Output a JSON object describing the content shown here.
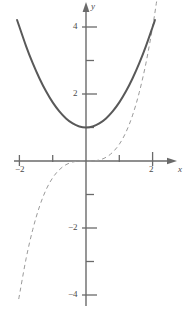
{
  "figure": {
    "background_color": "#ffffff",
    "width": 187,
    "height": 316
  },
  "axes": {
    "x_axis_label": "x",
    "y_axis_label": "y",
    "axis_color": "#6a6a6a",
    "origin_px": {
      "x": 86,
      "y": 161
    },
    "px_per_unit_x": 33.3,
    "px_per_unit_y": 33.5
  },
  "x_ticks": [
    {
      "value": -2,
      "label": "−2"
    },
    {
      "value": -1,
      "label": ""
    },
    {
      "value": 1,
      "label": ""
    },
    {
      "value": 2,
      "label": "2"
    }
  ],
  "y_ticks": [
    {
      "value": 4,
      "label": "4"
    },
    {
      "value": 3,
      "label": ""
    },
    {
      "value": 2,
      "label": "2"
    },
    {
      "value": 1,
      "label": ""
    },
    {
      "value": -1,
      "label": ""
    },
    {
      "value": -2,
      "label": "−2"
    },
    {
      "value": -3,
      "label": ""
    },
    {
      "value": -4,
      "label": "−4"
    }
  ],
  "chart_data": {
    "type": "line",
    "title": "",
    "xlabel": "x",
    "ylabel": "y",
    "xlim": [
      -2.15,
      2.7
    ],
    "ylim": [
      -4.6,
      4.65
    ],
    "grid": false,
    "legend": "none",
    "series": [
      {
        "name": "parabola",
        "style": "solid",
        "color": "#595959",
        "width": 2.0,
        "equation": "y = 1 + 0.75*x^2",
        "x": [
          -2.07,
          -1.8,
          -1.6,
          -1.4,
          -1.2,
          -1.0,
          -0.8,
          -0.6,
          -0.4,
          -0.2,
          0,
          0.2,
          0.4,
          0.6,
          0.8,
          1.0,
          1.2,
          1.4,
          1.6,
          1.8,
          2.0,
          2.07
        ],
        "values": [
          4.21,
          3.43,
          2.92,
          2.47,
          2.08,
          1.75,
          1.48,
          1.27,
          1.12,
          1.03,
          1.0,
          1.03,
          1.12,
          1.27,
          1.48,
          1.75,
          2.08,
          2.47,
          2.92,
          3.43,
          4.0,
          4.21
        ]
      },
      {
        "name": "cubic",
        "style": "dashed",
        "color": "#9a9a9a",
        "width": 1.0,
        "equation": "y = 0.5*x^3",
        "x": [
          -2.02,
          -1.8,
          -1.6,
          -1.4,
          -1.2,
          -1.0,
          -0.8,
          -0.6,
          -0.4,
          -0.2,
          0,
          0.2,
          0.4,
          0.6,
          0.8,
          1.0,
          1.2,
          1.4,
          1.6,
          1.8,
          2.0,
          2.12
        ],
        "values": [
          -4.12,
          -2.92,
          -2.05,
          -1.37,
          -0.86,
          -0.5,
          -0.26,
          -0.11,
          -0.03,
          0.0,
          0.0,
          0.0,
          0.03,
          0.11,
          0.26,
          0.5,
          0.86,
          1.37,
          2.05,
          2.92,
          4.0,
          4.76
        ]
      }
    ]
  }
}
